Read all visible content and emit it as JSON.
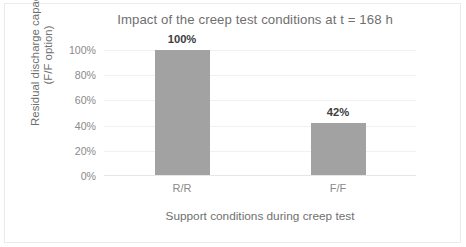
{
  "chart_data": {
    "type": "bar",
    "title": "Impact of the creep test conditions at t = 168 h",
    "xlabel": "Support conditions during creep test",
    "ylabel": "Residual discharge capacity\n(F/F option)",
    "ylabel_lines": [
      "Residual discharge capacity",
      "(F/F option)"
    ],
    "categories": [
      "R/R",
      "F/F"
    ],
    "values": [
      100,
      42
    ],
    "value_labels": [
      "100%",
      "42%"
    ],
    "ylim": [
      0,
      100
    ],
    "yticks": [
      0,
      20,
      40,
      60,
      80,
      100
    ],
    "ytick_labels": [
      "0%",
      "20%",
      "40%",
      "60%",
      "80%",
      "100%"
    ],
    "grid": true,
    "grid_axis": "y",
    "legend": false,
    "bar_color": "#a2a2a2",
    "title_color": "#6f6f6f",
    "tick_color": "#8a8a8a",
    "gridline_color": "#f1f1f1",
    "background_color": "#ffffff",
    "value_label_color": "#3d3d3d"
  }
}
